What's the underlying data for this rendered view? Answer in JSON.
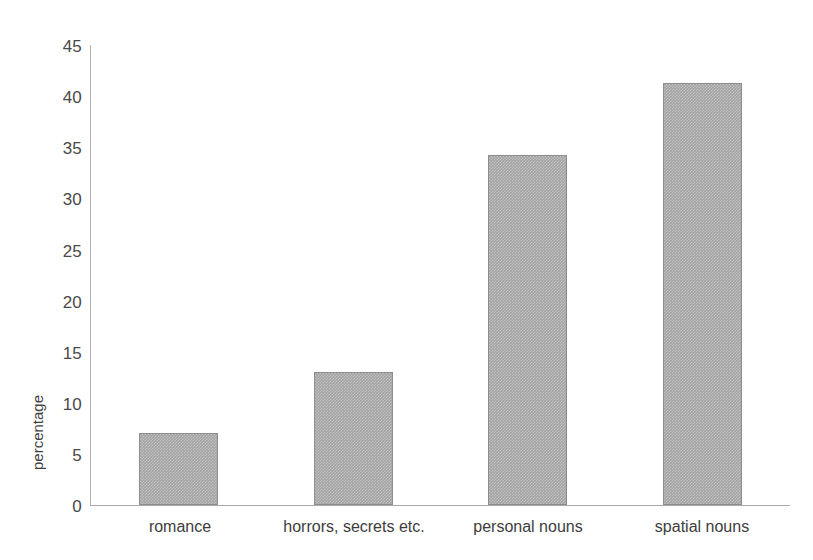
{
  "chart_data": {
    "type": "bar",
    "title": "",
    "subtitle": "",
    "xlabel": "",
    "ylabel": "percentage",
    "categories": [
      "romance",
      "horrors, secrets etc.",
      "personal nouns",
      "spatial nouns"
    ],
    "values": [
      7.0,
      13.0,
      34.2,
      41.3
    ],
    "series": [
      {
        "name": "percentage",
        "values": [
          7.0,
          13.0,
          34.2,
          41.3
        ]
      }
    ],
    "ylim": [
      0,
      45
    ],
    "ytick_labels": [
      "0",
      "5",
      "10",
      "15",
      "20",
      "25",
      "30",
      "35",
      "40",
      "45"
    ],
    "ytick_values": [
      0,
      5,
      10,
      15,
      20,
      25,
      30,
      35,
      40,
      45
    ],
    "grid": false,
    "legend": false,
    "legend_position": "none",
    "annotations": [],
    "colors": {
      "bar_fill": "#a3a3a3",
      "bar_border": "#8d8d8d",
      "axis": "#a8a8a8",
      "text": "#3d3d3d",
      "background": "#ffffff"
    }
  }
}
